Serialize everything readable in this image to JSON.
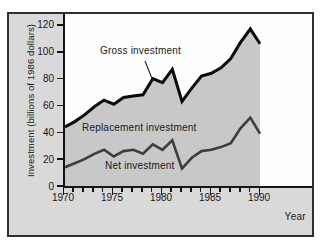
{
  "figure": {
    "y_axis_title": "Investment (billions of 1986 dollars)",
    "x_axis_title": "Year"
  },
  "annotations": {
    "gross_label": "Gross investment",
    "replacement_label": "Replacement investment",
    "net_label": "Net investment"
  },
  "colors": {
    "figure_bg": "#d9d9d9",
    "plot_bg": "#fefefe",
    "shaded_area": "#c8c8c8",
    "gross_line": "#0a0a0a",
    "net_line": "#3d3d3d",
    "axis": "#141414",
    "frame_border": "#2f2f2f"
  },
  "chart_data": {
    "type": "area",
    "title": "",
    "xlabel": "Year",
    "ylabel": "Investment (billions of 1986 dollars)",
    "x": [
      1970,
      1971,
      1972,
      1973,
      1974,
      1975,
      1976,
      1977,
      1978,
      1979,
      1980,
      1981,
      1982,
      1983,
      1984,
      1985,
      1986,
      1987,
      1988,
      1989,
      1990
    ],
    "series": [
      {
        "name": "Gross investment",
        "color": "#0a0a0a",
        "values": [
          44,
          48,
          53,
          59,
          64,
          61,
          66,
          67,
          68,
          80,
          77,
          87,
          63,
          73,
          82,
          84,
          88,
          95,
          107,
          117,
          106
        ]
      },
      {
        "name": "Net investment",
        "color": "#3d3d3d",
        "values": [
          14,
          17,
          20,
          24,
          27,
          22,
          26,
          27,
          24,
          31,
          27,
          34,
          13,
          21,
          26,
          27,
          29,
          32,
          43,
          51,
          39
        ]
      }
    ],
    "shaded_region": "area under Gross investment curve from 1970 to 1990; band between lines labeled Replacement investment",
    "ylim": [
      0,
      120
    ],
    "xlim": [
      1970,
      1995
    ],
    "y_ticks": [
      0,
      20,
      40,
      60,
      80,
      100,
      120
    ],
    "x_minor_tick_years": "every year 1970-1990",
    "x_tick_labels": [
      1970,
      1975,
      1980,
      1985,
      1990
    ],
    "grid": false,
    "legend_position": "inline-annotations"
  }
}
